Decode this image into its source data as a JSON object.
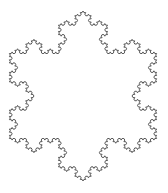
{
  "figure": {
    "shape": "koch-snowflake",
    "iterations": 4,
    "center": [
      83,
      96
    ],
    "radius": 85,
    "stroke_color": "#555555",
    "stroke_width": 1,
    "fill_color": "#ffffff",
    "background": "#ffffff"
  }
}
